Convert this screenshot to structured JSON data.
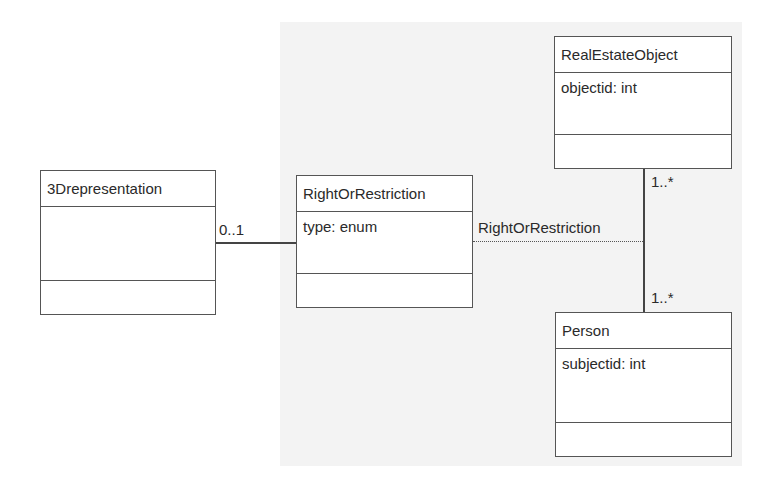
{
  "diagram": {
    "type": "UML class diagram",
    "classes": [
      {
        "id": "3drep",
        "name": "3Drepresentation",
        "attributes": [],
        "operations": []
      },
      {
        "id": "ror",
        "name": "RightOrRestriction",
        "attributes": [
          "type: enum"
        ],
        "operations": []
      },
      {
        "id": "reo",
        "name": "RealEstateObject",
        "attributes": [
          "objectid: int"
        ],
        "operations": []
      },
      {
        "id": "person",
        "name": "Person",
        "attributes": [
          "subjectid: int"
        ],
        "operations": []
      }
    ],
    "associations": [
      {
        "from": "3Drepresentation",
        "to": "RightOrRestriction",
        "multiplicity_from_end": "0..1",
        "style": "solid"
      },
      {
        "from": "RealEstateObject",
        "to": "Person",
        "multiplicity_top": "1..*",
        "multiplicity_bottom": "1..*",
        "style": "solid"
      },
      {
        "from": "RightOrRestriction",
        "to": "RealEstateObject-Person association",
        "label": "RightOrRestriction",
        "style": "dashed",
        "kind": "association-class"
      }
    ],
    "labels": {
      "mult_3drep": "0..1",
      "mult_reo": "1..*",
      "mult_person": "1..*",
      "assoc_class_label": "RightOrRestriction"
    },
    "colors": {
      "background": "#ffffff",
      "panel": "#f3f3f3",
      "stroke": "#555555"
    }
  }
}
